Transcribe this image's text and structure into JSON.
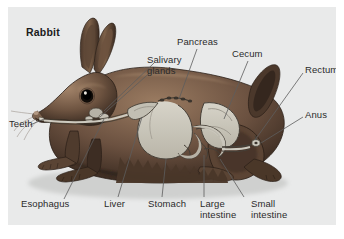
{
  "figure": {
    "title": "Rabbit",
    "background_color": "#e9eaea",
    "frame_color": "#ffffff",
    "label_color": "#2b2b2b",
    "fur_color": "#6b5243",
    "fur_shadow_color": "#3a2b22",
    "fur_highlight_color": "#a98b71",
    "organ_fill_color": "#c9c6bb",
    "organ_outline_color": "#4a443c",
    "leader_color": "#5a5a5a"
  },
  "labels": [
    {
      "id": "rabbit",
      "text": "Rabbit"
    },
    {
      "id": "salivary-glands",
      "text": "Salivary\nglands"
    },
    {
      "id": "pancreas",
      "text": "Pancreas"
    },
    {
      "id": "cecum",
      "text": "Cecum"
    },
    {
      "id": "rectum",
      "text": "Rectum"
    },
    {
      "id": "anus",
      "text": "Anus"
    },
    {
      "id": "teeth",
      "text": "Teeth"
    },
    {
      "id": "esophagus",
      "text": "Esophagus"
    },
    {
      "id": "liver",
      "text": "Liver"
    },
    {
      "id": "stomach",
      "text": "Stomach"
    },
    {
      "id": "large-intestine",
      "text": "Large\nintestine"
    },
    {
      "id": "small-intestine",
      "text": "Small\nintestine"
    }
  ],
  "label_text": {
    "rabbit": "Rabbit",
    "salivary_glands_line1": "Salivary",
    "salivary_glands_line2": "glands",
    "pancreas": "Pancreas",
    "cecum": "Cecum",
    "rectum": "Rectum",
    "anus": "Anus",
    "teeth": "Teeth",
    "esophagus": "Esophagus",
    "liver": "Liver",
    "stomach": "Stomach",
    "large_intestine_line1": "Large",
    "large_intestine_line2": "intestine",
    "small_intestine_line1": "Small",
    "small_intestine_line2": "intestine"
  }
}
